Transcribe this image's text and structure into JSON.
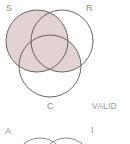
{
  "figure": {
    "title_caption": "VALID",
    "colors": {
      "shade": "#e3d2d3",
      "stroke": "#595652",
      "label": "#8e8e8e",
      "background": "#ffffff"
    },
    "diagram_top": {
      "type": "venn-3-circle",
      "status_label": "VALID",
      "circles": [
        {
          "id": "S",
          "label": "S",
          "cx": 37,
          "cy": 41,
          "r": 31
        },
        {
          "id": "R",
          "label": "R",
          "cx": 62,
          "cy": 41,
          "r": 31
        },
        {
          "id": "C",
          "label": "C",
          "cx": 50,
          "cy": 66,
          "r": 31
        }
      ],
      "shaded_regions": [
        "S",
        "R-and-C"
      ]
    },
    "diagram_bottom": {
      "type": "venn-partial-cropped",
      "labels": {
        "left": "A",
        "right": "I"
      }
    }
  },
  "labels": {
    "s": "S",
    "r": "R",
    "c": "C",
    "valid": "VALID",
    "a": "A",
    "i": "I"
  }
}
